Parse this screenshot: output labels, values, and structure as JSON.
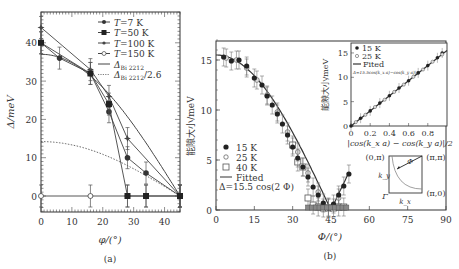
{
  "chart_data": [
    {
      "panel": "(a)",
      "type": "line",
      "xlabel": "φ/(°)",
      "ylabel": "Δ_peak/meV",
      "xlim": [
        0,
        45
      ],
      "ylim": [
        -4,
        48
      ],
      "xticks": [
        0,
        10,
        20,
        30,
        40
      ],
      "yticks": [
        0,
        10,
        20,
        30,
        40
      ],
      "legend_position": "upper right",
      "series": [
        {
          "name": "T=7 K",
          "marker": "filled-circle-small",
          "x": [
            0,
            6,
            16,
            22,
            28,
            34,
            45
          ],
          "y": [
            40,
            36,
            32,
            22,
            10,
            6,
            0
          ]
        },
        {
          "name": "T=50 K",
          "marker": "filled-square",
          "x": [
            0,
            16,
            22,
            28,
            34,
            45
          ],
          "y": [
            40,
            32,
            24,
            0,
            0,
            0
          ]
        },
        {
          "name": "T=100 K",
          "marker": "star",
          "x": [
            0,
            16,
            22,
            28,
            45
          ],
          "y": [
            44,
            33,
            26,
            15,
            0
          ]
        },
        {
          "name": "T=150 K",
          "marker": "open-circle",
          "x": [
            0,
            16,
            28,
            34,
            45
          ],
          "y": [
            0,
            0,
            0,
            0,
            0
          ]
        },
        {
          "name": "Δ_Bi 2212",
          "style": "solid",
          "x": [
            0,
            10,
            20,
            30,
            40,
            45
          ],
          "y": [
            37,
            35.2,
            30.2,
            21.7,
            9.5,
            0
          ]
        },
        {
          "name": "Δ_Bi 2212/2.6",
          "style": "dotted",
          "x": [
            0,
            10,
            20,
            30,
            40,
            45
          ],
          "y": [
            14.2,
            13.5,
            11.6,
            8.4,
            3.7,
            0
          ]
        }
      ],
      "legend": [
        "T=7 K",
        "T=50 K",
        "T=100 K",
        "T=150 K",
        "Δ_Bi 2212",
        "Δ_Bi 2212/2.6"
      ]
    },
    {
      "panel": "(b)",
      "type": "scatter",
      "xlabel": "Φ/(°)",
      "ylabel": "能隙大小/meV",
      "xlim": [
        0,
        90
      ],
      "ylim": [
        0,
        17
      ],
      "xticks": [
        0,
        15,
        30,
        45,
        60,
        75,
        90
      ],
      "yticks": [
        0,
        5,
        10,
        15
      ],
      "legend_position": "lower left",
      "series": [
        {
          "name": "15 K",
          "marker": "filled-circle",
          "x": [
            3,
            6,
            9,
            12,
            15,
            18,
            20,
            22,
            24,
            26,
            28,
            30,
            32,
            34,
            36,
            38,
            40,
            42,
            44,
            46,
            48,
            50,
            52
          ],
          "y": [
            15.3,
            14.9,
            15.0,
            14.4,
            13.2,
            12.5,
            11.4,
            10.5,
            9.6,
            8.6,
            7.5,
            6.3,
            5.2,
            4.3,
            3.3,
            2.3,
            1.5,
            0.7,
            0.2,
            0.6,
            1.5,
            2.4,
            3.6
          ]
        },
        {
          "name": "25 K",
          "marker": "open-circle",
          "x": [
            4,
            8,
            12,
            16,
            20,
            24,
            28,
            32,
            36,
            40,
            44,
            48
          ],
          "y": [
            15.2,
            15.0,
            14.2,
            13.0,
            11.5,
            9.8,
            7.8,
            5.8,
            3.7,
            1.8,
            0.3,
            1.2
          ]
        },
        {
          "name": "40 K",
          "marker": "open-square",
          "x": [
            30,
            32,
            34,
            36,
            38,
            40,
            42,
            44,
            46,
            48,
            50
          ],
          "y": [
            6.5,
            4.8,
            4.3,
            1.2,
            0.5,
            0.3,
            0.2,
            0.2,
            0.2,
            0.3,
            0.3
          ]
        },
        {
          "name": "Fitted",
          "style": "solid",
          "formula": "Δ=15.5 cos(2Φ)"
        }
      ],
      "legend": [
        "15 K",
        "25 K",
        "40 K",
        "Fitted",
        "Δ=15.5 cos(2 Φ)"
      ],
      "inset": {
        "type": "scatter",
        "xlabel": "|cos(k_x a) − cos(k_y a)|/2",
        "ylabel": "能隙大小/meV",
        "xlim": [
          0,
          1
        ],
        "ylim": [
          0,
          17
        ],
        "xticks": [
          0,
          0.2,
          0.4,
          0.6,
          0.8
        ],
        "yticks": [
          0,
          5,
          10,
          15
        ],
        "legend": [
          "15 K",
          "25 K",
          "Fited",
          "Δ=15.5cos(k_x a)−cos(k_y a)|/2"
        ],
        "series": [
          {
            "name": "15 K",
            "x": [
              0,
              0.1,
              0.2,
              0.3,
              0.4,
              0.5,
              0.6,
              0.7,
              0.8,
              0.9,
              0.95
            ],
            "y": [
              0,
              1.6,
              3.1,
              4.7,
              6.2,
              7.8,
              9.3,
              10.9,
              12.4,
              14.0,
              15.0
            ]
          },
          {
            "name": "25 K",
            "x": [
              0.05,
              0.15,
              0.25,
              0.35,
              0.45,
              0.55,
              0.65,
              0.75,
              0.85,
              0.95
            ],
            "y": [
              0.8,
              2.3,
              3.9,
              5.4,
              7.0,
              8.5,
              10.1,
              11.6,
              13.2,
              14.7
            ]
          },
          {
            "name": "Fited",
            "x": [
              0,
              1
            ],
            "y": [
              0,
              15.5
            ]
          }
        ]
      },
      "brillouin_zone_inset": {
        "corners": [
          "(0,π)",
          "(π,π)",
          "(π,0)",
          "Γ"
        ],
        "axes": [
          "k_x",
          "k_y"
        ],
        "angle_label": "Φ"
      }
    }
  ],
  "labels": {
    "panel_a": "(a)",
    "panel_b": "(b)"
  }
}
